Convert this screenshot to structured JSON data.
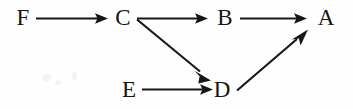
{
  "diagram": {
    "type": "directed-graph",
    "background_color": "#fefefe",
    "ink_color": "#161616",
    "width": 353,
    "height": 109,
    "nodes": [
      {
        "id": "F",
        "label": "F",
        "x": 23,
        "y": 17
      },
      {
        "id": "C",
        "label": "C",
        "x": 123,
        "y": 17
      },
      {
        "id": "B",
        "label": "B",
        "x": 225,
        "y": 17
      },
      {
        "id": "A",
        "label": "A",
        "x": 326,
        "y": 17
      },
      {
        "id": "E",
        "label": "E",
        "x": 129,
        "y": 89
      },
      {
        "id": "D",
        "label": "D",
        "x": 222,
        "y": 89
      }
    ],
    "edges": [
      {
        "from": "F",
        "to": "C",
        "label": "",
        "shape": "horizontal"
      },
      {
        "from": "C",
        "to": "B",
        "label": "",
        "shape": "horizontal"
      },
      {
        "from": "B",
        "to": "A",
        "label": "",
        "shape": "horizontal"
      },
      {
        "from": "E",
        "to": "D",
        "label": "",
        "shape": "horizontal"
      },
      {
        "from": "C",
        "to": "D",
        "label": "",
        "shape": "diagonal-down-right"
      },
      {
        "from": "D",
        "to": "A",
        "label": "",
        "shape": "diagonal-up-right"
      }
    ]
  }
}
